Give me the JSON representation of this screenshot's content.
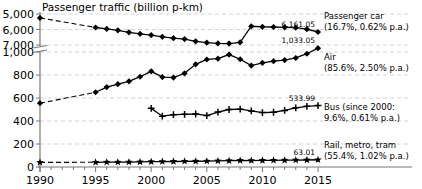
{
  "chart_data": {
    "type": "line",
    "title": "Passenger traffic (billion p-km)",
    "xlabel": "",
    "ylabel": "",
    "grid": true,
    "legend_position": "right-inline-annotations",
    "axis_break": {
      "lower_top": 1000,
      "upper_bottom": 5000,
      "note": "y-axis broken between 1,000 and 5,000"
    },
    "x_ticks": [
      "1990",
      "1995",
      "2000",
      "2005",
      "2010",
      "2015"
    ],
    "x_range": [
      1990,
      2015
    ],
    "y_ticks_lower": [
      "0",
      "200",
      "400",
      "600",
      "800",
      "1,000"
    ],
    "y_ticks_upper": [
      "5,000",
      "6,000",
      "7,000"
    ],
    "ylim_lower": [
      0,
      1000
    ],
    "ylim_upper": [
      5000,
      7000
    ],
    "series": [
      {
        "name": "Passenger car",
        "marker": "diamond",
        "end_value": "6,161.05",
        "label": "Passenger car",
        "sublabel": "(16.7%, 0.62% p.a.)",
        "share_pct": "16.7%",
        "growth_pa": "0.62% p.a.",
        "dashed_from": 1990,
        "dashed_to": 1995,
        "x": [
          1990,
          1995,
          1996,
          1997,
          1998,
          1999,
          2000,
          2001,
          2002,
          2003,
          2004,
          2005,
          2006,
          2007,
          2008,
          2009,
          2010,
          2011,
          2012,
          2013,
          2014,
          2015
        ],
        "values": [
          5250,
          5870,
          5960,
          6050,
          6180,
          6280,
          6360,
          6470,
          6560,
          6620,
          6760,
          6850,
          6900,
          6910,
          6830,
          5790,
          5830,
          5840,
          5860,
          5880,
          5980,
          6161.05
        ]
      },
      {
        "name": "Air",
        "marker": "diamond",
        "end_value": "1,033.05",
        "label": "Air",
        "sublabel": "(85.6%, 2.50% p.a.)",
        "share_pct": "85.6%",
        "growth_pa": "2.50% p.a.",
        "dashed_from": 1990,
        "dashed_to": 1995,
        "x": [
          1990,
          1995,
          1996,
          1997,
          1998,
          1999,
          2000,
          2001,
          2002,
          2003,
          2004,
          2005,
          2006,
          2007,
          2008,
          2009,
          2010,
          2011,
          2012,
          2013,
          2014,
          2015
        ],
        "values": [
          555,
          650,
          695,
          720,
          745,
          785,
          832,
          782,
          778,
          815,
          893,
          935,
          942,
          978,
          937,
          882,
          905,
          920,
          930,
          948,
          985,
          1033.05
        ]
      },
      {
        "name": "Bus (since 2000)",
        "marker": "plus",
        "end_value": "533.99",
        "label": "Bus (since 2000:",
        "sublabel": "9.6%, 0.61% p.a.)",
        "share_pct": "9.6%",
        "growth_pa": "0.61% p.a.",
        "x": [
          2000,
          2001,
          2002,
          2003,
          2004,
          2005,
          2006,
          2007,
          2008,
          2009,
          2010,
          2011,
          2012,
          2013,
          2014,
          2015
        ],
        "values": [
          510,
          442,
          455,
          458,
          461,
          447,
          478,
          500,
          503,
          488,
          473,
          476,
          492,
          515,
          528,
          533.99
        ]
      },
      {
        "name": "Rail, metro, tram",
        "marker": "star",
        "end_value": "63.01",
        "label": "Rail, metro, tram",
        "sublabel": "(55.4%, 1.02% p.a.)",
        "share_pct": "55.4%",
        "growth_pa": "1.02% p.a.",
        "dashed_from": 1990,
        "dashed_to": 1995,
        "x": [
          1990,
          1995,
          1996,
          1997,
          1998,
          1999,
          2000,
          2001,
          2002,
          2003,
          2004,
          2005,
          2006,
          2007,
          2008,
          2009,
          2010,
          2011,
          2012,
          2013,
          2014,
          2015
        ],
        "values": [
          40,
          41,
          42,
          42,
          43,
          44,
          46,
          47,
          48,
          49,
          50,
          51,
          53,
          55,
          57,
          56,
          57,
          58,
          59,
          60,
          61,
          63.01
        ]
      }
    ]
  }
}
